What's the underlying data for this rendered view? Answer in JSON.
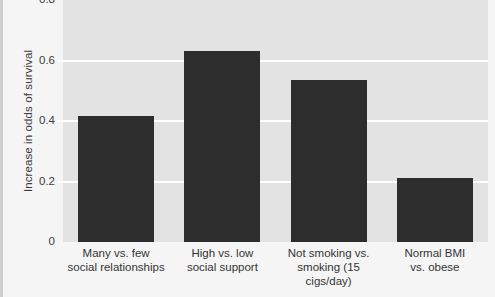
{
  "chart_data": {
    "type": "bar",
    "title": "",
    "subtitle": "",
    "xlabel": "",
    "ylabel": "Increase in odds of survival",
    "categories": [
      "Many vs. few\nsocial relationships",
      "High vs. low\nsocial support",
      "Not smoking vs.\nsmoking (15 cigs/day)",
      "Normal BMI\nvs. obese"
    ],
    "values": [
      0.415,
      0.63,
      0.535,
      0.21
    ],
    "ylim": [
      0,
      0.8
    ],
    "yticks": [
      0,
      0.2,
      0.4,
      0.6,
      0.8
    ],
    "ytick_labels": [
      "0",
      "0.2",
      "0.4",
      "0.6",
      "0.8"
    ],
    "grid": true,
    "grid_axis": "y",
    "legend": false,
    "legend_position": "none",
    "bar_color": "#2d2d2d",
    "panel_color": "#e3e3e3",
    "grid_color": "#ffffff"
  }
}
